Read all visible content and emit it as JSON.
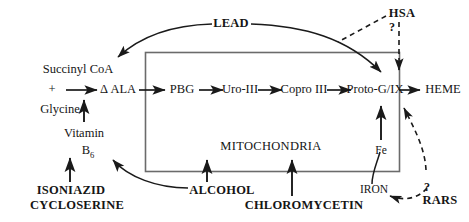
{
  "diagram": {
    "compartment_label": "MITOCHONDRIA",
    "colors": {
      "stroke": "#1a1a1a",
      "box_stroke": "#6b6b6b",
      "background": "#ffffff",
      "text": "#151515"
    },
    "precursors": {
      "succinyl_coa": "Succinyl CoA",
      "plus": "+",
      "glycine": "Glycine"
    },
    "pathway": [
      {
        "id": "d-ala",
        "label": "Δ ALA"
      },
      {
        "id": "pbg",
        "label": "PBG"
      },
      {
        "id": "uro3",
        "label": "Uro-III"
      },
      {
        "id": "copro3",
        "label": "Copro III"
      },
      {
        "id": "protog",
        "label": "Proto-G/IX"
      },
      {
        "id": "heme",
        "label": "HEME"
      }
    ],
    "cofactors": {
      "vitamin": "Vitamin",
      "vitamin_b": "B",
      "vitamin_b_sub": "6",
      "iron_symbol": "Fe",
      "iron_label": "IRON"
    },
    "inhibitors": {
      "lead": "LEAD",
      "isoniazid": "ISONIAZID",
      "cycloserine": "CYCLOSERINE",
      "alcohol": "ALCOHOL",
      "chloromycetin": "CHLOROMYCETIN"
    },
    "conditions": {
      "hsa": "HSA",
      "rars": "RARS",
      "hsa_query": "?",
      "rars_query": "?"
    }
  }
}
